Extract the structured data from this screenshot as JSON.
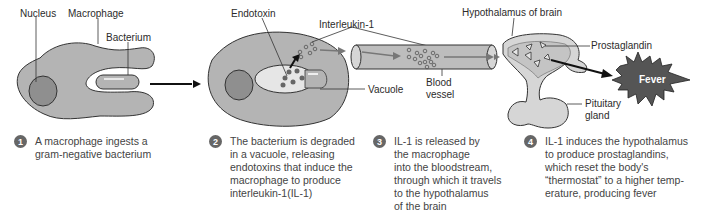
{
  "colors": {
    "cell_fill": "#b4b4b4",
    "nucleus_fill": "#8f8f8f",
    "vacuole_fill": "#e6e6e6",
    "vessel_fill": "#bdbdbd",
    "fever_fill": "#555555",
    "number_badge": "#666666"
  },
  "labels": {
    "nucleus": "Nucleus",
    "macrophage": "Macrophage",
    "bacterium": "Bacterium",
    "endotoxin": "Endotoxin",
    "interleukin": "Interleukin-1",
    "vacuole": "Vacuole",
    "blood_vessel_line1": "Blood",
    "blood_vessel_line2": "vessel",
    "hypothalamus": "Hypothalamus of brain",
    "prostaglandin": "Prostaglandin",
    "pituitary_line1": "Pituitary",
    "pituitary_line2": "gland",
    "fever": "Fever"
  },
  "steps": [
    {
      "number": "1",
      "lines": [
        "A macrophage ingests a",
        "gram-negative bacterium"
      ]
    },
    {
      "number": "2",
      "lines": [
        "The bacterium is degraded",
        "in a vacuole, releasing",
        "endotoxins that induce the",
        "macrophage to produce",
        "interleukin-1(IL-1)"
      ]
    },
    {
      "number": "3",
      "lines": [
        "IL-1 is released by",
        "the macrophage",
        "into the bloodstream,",
        "through which it travels",
        "to the hypothalamus",
        "of the brain"
      ]
    },
    {
      "number": "4",
      "lines": [
        "IL-1 induces the hypothalamus",
        "to produce prostaglandins,",
        "which reset the body's",
        "“thermostat” to a higher temp-",
        "erature, producing fever"
      ]
    }
  ]
}
